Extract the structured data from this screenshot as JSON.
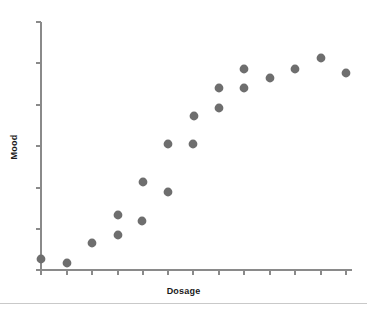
{
  "chart_data": {
    "type": "scatter",
    "title": "",
    "xlabel": "Dosage",
    "ylabel": "Mood",
    "grid": false,
    "legend": null,
    "xlim": [
      0,
      13
    ],
    "ylim": [
      0,
      6
    ],
    "x_tick_labels": [],
    "y_tick_labels": [],
    "x_tick_count": 13,
    "y_tick_count": 6,
    "point_color": "#6e6e6e",
    "point_radius": 4.4,
    "axis_color": "#8a8a8a",
    "n_points": 19,
    "x": [
      0.0,
      1.0,
      2.0,
      3.0,
      3.0,
      4.0,
      4.2,
      5.1,
      5.2,
      6.1,
      6.2,
      7.2,
      7.3,
      8.2,
      8.3,
      9.2,
      10.3,
      11.3,
      12.3
    ],
    "y": [
      0.23,
      0.14,
      0.66,
      1.11,
      0.81,
      1.0,
      1.62,
      2.4,
      1.9,
      2.4,
      3.0,
      3.28,
      3.78,
      3.78,
      4.25,
      4.0,
      4.25,
      4.5,
      4.13
    ],
    "points": [
      {
        "px": 41,
        "py": 259
      },
      {
        "px": 67,
        "py": 263
      },
      {
        "px": 92,
        "py": 243
      },
      {
        "px": 118,
        "py": 215
      },
      {
        "px": 118,
        "py": 235
      },
      {
        "px": 142,
        "py": 221
      },
      {
        "px": 143,
        "py": 182
      },
      {
        "px": 168,
        "py": 144
      },
      {
        "px": 168,
        "py": 192
      },
      {
        "px": 193,
        "py": 144
      },
      {
        "px": 194,
        "py": 116
      },
      {
        "px": 219,
        "py": 108
      },
      {
        "px": 219,
        "py": 88
      },
      {
        "px": 244,
        "py": 88
      },
      {
        "px": 244,
        "py": 69
      },
      {
        "px": 270,
        "py": 78
      },
      {
        "px": 295,
        "py": 69
      },
      {
        "px": 321,
        "py": 58
      },
      {
        "px": 346,
        "py": 73
      }
    ]
  },
  "axes": {
    "x_title": "Dosage",
    "y_title": "Mood",
    "x_axis_pixels": {
      "x1": 41,
      "x2": 352,
      "y": 270
    },
    "y_axis_pixels": {
      "x": 41,
      "y1": 22,
      "y2": 270
    },
    "x_tick_pixels": [
      41,
      67,
      92,
      118,
      143,
      168,
      193,
      219,
      244,
      270,
      295,
      321,
      346
    ],
    "y_tick_pixels": [
      22,
      63,
      105,
      146,
      188,
      229,
      270
    ],
    "tick_length": 5
  },
  "footer": {
    "rule_y": 303
  }
}
